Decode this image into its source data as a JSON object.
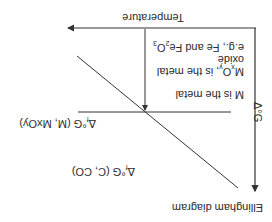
{
  "figure": {
    "title": "Ellingham diagram",
    "orientation": "rotated-180",
    "axes": {
      "y_label": "Δ°G",
      "x_label": "Temperature"
    },
    "lines": {
      "horizontal_label_main": "Δ",
      "horizontal_label_sub": "f",
      "horizontal_label_rest": "°G (M, MxOy)",
      "diagonal_label_main": "Δ",
      "diagonal_label_sub": "f",
      "diagonal_label_rest": "°G (C, CO)"
    },
    "annotations": {
      "line1": "M is the metal",
      "line2_a": "M",
      "line2_sub1": "x",
      "line2_b": "O",
      "line2_sub2": "y",
      "line2_c": ", is the metal",
      "line3": "oxide",
      "line4_a": "e.g., Fe and Fe",
      "line4_sub1": "2",
      "line4_b": "O",
      "line4_sub2": "3"
    },
    "colors": {
      "line": "#333333",
      "text": "#2a2a2a",
      "background": "#ffffff"
    }
  }
}
